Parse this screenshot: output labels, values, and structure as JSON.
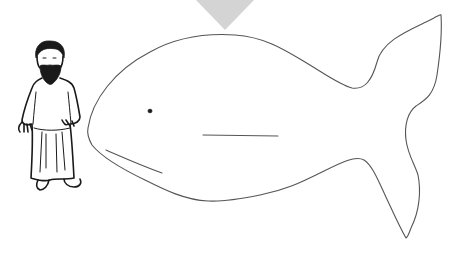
{
  "scene": {
    "title": "Jonah and the whale coloring page",
    "background_color": "#ffffff",
    "line_color": "#555555",
    "ink_color": "#1a1a1a",
    "marker_color": "#d4d4d4"
  },
  "elements": {
    "marker": {
      "shape": "downward-triangle"
    },
    "man": {
      "description": "bearded man in a long robe with sandals"
    },
    "whale": {
      "description": "large fish/whale outline facing left",
      "parts": [
        "body",
        "tail",
        "eye",
        "mouth",
        "lateral-line"
      ]
    }
  }
}
